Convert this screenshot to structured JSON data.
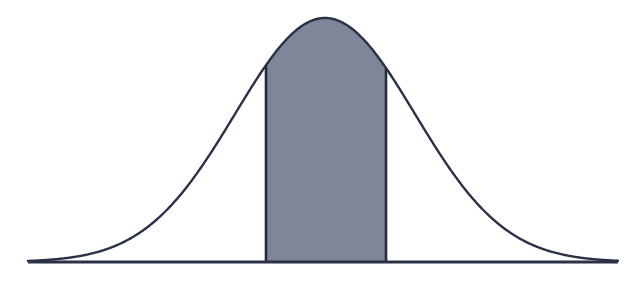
{
  "figure": {
    "name": "normal-distribution-shaded-interval",
    "width": 644,
    "height": 283,
    "background_color": "#ffffff",
    "title": "",
    "subtitle": "",
    "caption": ""
  },
  "style": {
    "curve_stroke_color": "#2b3147",
    "curve_stroke_width": 2.4,
    "axis_stroke_color": "#2b3147",
    "axis_stroke_width": 3.2,
    "shade_fill_color": "#7d8799",
    "shade_edge_color": "#262c40",
    "shade_edge_width": 2.6
  },
  "chart_data": {
    "type": "area",
    "title": "",
    "subtitle": "",
    "xlabel": "",
    "ylabel": "",
    "grid": false,
    "legend": null,
    "axis_labels_visible": false,
    "tick_labels": [],
    "annotations": [],
    "distribution": {
      "kind": "normal",
      "mean_px": 325,
      "sigma_px": 90,
      "peak_y_px": 18,
      "baseline_y_px": 262,
      "amplitude_px": 244
    },
    "axis": {
      "baseline_y_px": 262,
      "x_start_px": 28,
      "x_end_px": 618,
      "ylim": [
        0,
        244
      ],
      "xlim": [
        28,
        618
      ]
    },
    "shaded_interval": {
      "x_start_px": 266,
      "x_end_px": 386,
      "label": "",
      "z_start": -0.66,
      "z_end": 0.68
    },
    "x": [
      28,
      50,
      75,
      100,
      125,
      150,
      175,
      200,
      225,
      250,
      266,
      275,
      300,
      325,
      350,
      375,
      386,
      400,
      425,
      450,
      475,
      500,
      525,
      550,
      575,
      600,
      618
    ],
    "y": [
      0.3,
      0.8,
      2.6,
      7.1,
      16.6,
      33.3,
      57.4,
      85.1,
      134.6,
      180.6,
      202.1,
      212.5,
      237.1,
      244.0,
      237.1,
      212.5,
      199.9,
      180.6,
      134.6,
      92.0,
      57.4,
      33.3,
      16.6,
      7.1,
      2.6,
      0.8,
      0.3
    ]
  }
}
